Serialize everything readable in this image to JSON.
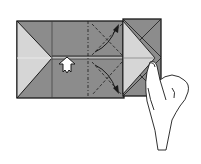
{
  "diagram": {
    "type": "origami-instruction-step",
    "colors": {
      "paper_dark": "#8c8c8c",
      "paper_light": "#d6d6d6",
      "outline": "#1a1a1a",
      "background": "#ffffff",
      "arrow_fill": "#ffffff"
    },
    "elements": [
      "folded-paper-rectangle",
      "left-triangle-flap",
      "right-square-flap",
      "valley-fold-line",
      "mountain-fold-line",
      "push-arrow",
      "fold-arrows",
      "hand"
    ]
  }
}
